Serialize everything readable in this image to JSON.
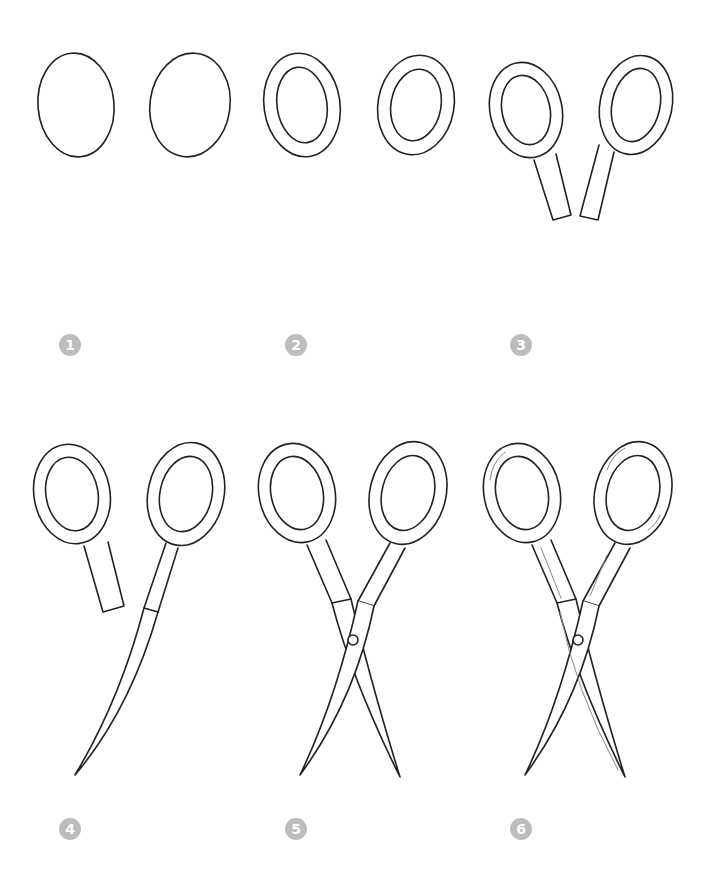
{
  "colors": {
    "line": "#222222",
    "badge": "#bdbdbd",
    "badge_text": "#ffffff",
    "background": "#ffffff"
  },
  "steps": [
    {
      "number": "1",
      "description": "Two oval shapes"
    },
    {
      "number": "2",
      "description": "Inner ovals form finger loops"
    },
    {
      "number": "3",
      "description": "Handle shanks added"
    },
    {
      "number": "4",
      "description": "One long blade drawn"
    },
    {
      "number": "5",
      "description": "Second blade crossing with pivot screw"
    },
    {
      "number": "6",
      "description": "Shading details added"
    }
  ]
}
